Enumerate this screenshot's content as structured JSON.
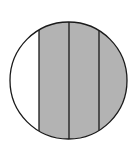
{
  "diagram": {
    "type": "fraction-circle",
    "circle": {
      "cx": 68.5,
      "cy": 80.5,
      "r": 58.5
    },
    "divider_x": [
      39,
      69,
      99
    ],
    "strips": [
      {
        "index": 0,
        "shaded": false
      },
      {
        "index": 1,
        "shaded": true
      },
      {
        "index": 2,
        "shaded": true
      },
      {
        "index": 3,
        "shaded": true
      }
    ],
    "colors": {
      "shaded": "#b3b3b3",
      "unshaded": "#ffffff",
      "stroke": "#1a1a1a"
    }
  }
}
